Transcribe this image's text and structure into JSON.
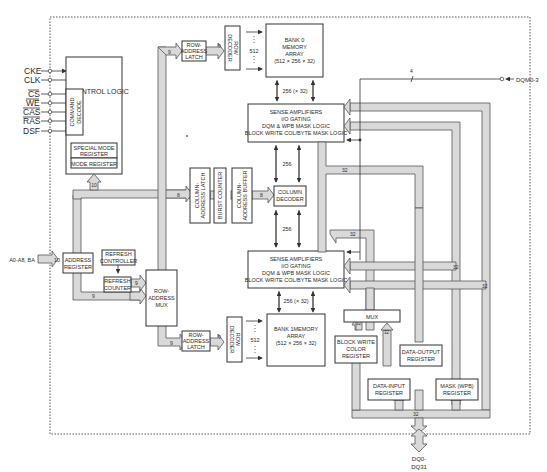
{
  "diagram": {
    "type": "block-diagram",
    "colors": {
      "line": "#333333",
      "bus_fill": "#d9d9d9",
      "background": "#ffffff"
    },
    "inputs": {
      "cke": "CKE",
      "clk": "CLK",
      "cs": "CS",
      "we": "WE",
      "cas": "CAS",
      "ras": "RAS",
      "dsf": "DSF",
      "address": "A0-A8, BA",
      "dqm": "DQM0-3",
      "dq_line1": "DQ0-",
      "dq_line2": "DQ31"
    },
    "blocks": {
      "control_logic": "CONTROL LOGIC",
      "command_decode_1": "COMMAND",
      "command_decode_2": "DECODE",
      "special_mode_register_1": "SPECIAL MODE",
      "special_mode_register_2": "REGISTER",
      "mode_register": "MODE REGISTER",
      "address_register_1": "ADDRESS",
      "address_register_2": "REGISTER",
      "refresh_controller_1": "REFRESH",
      "refresh_controller_2": "CONTROLLER",
      "refresh_counter_1": "REFRESH",
      "refresh_counter_2": "COUNTER",
      "row_address_mux_1": "ROW-",
      "row_address_mux_2": "ADDRESS",
      "row_address_mux_3": "MUX",
      "row_address_latch_top_1": "ROW-",
      "row_address_latch_top_2": "ADDRESS",
      "row_address_latch_top_3": "LATCH",
      "row_address_latch_bot_1": "ROW-",
      "row_address_latch_bot_2": "ADDRESS",
      "row_address_latch_bot_3": "LATCH",
      "row_decoder_top_1": "ROW",
      "row_decoder_top_2": "DECODER",
      "row_decoder_bot_1": "ROW",
      "row_decoder_bot_2": "DECODER",
      "bank0_1": "BANK 0",
      "bank0_2": "MEMORY",
      "bank0_3": "ARRAY",
      "bank0_4": "(512 × 256 × 32)",
      "bank1_1": "BANK 1MEMORY",
      "bank1_2": "ARRAY",
      "bank1_3": "(512 × 256 × 32)",
      "sense_top_1": "SENSE AMPLIFIERS",
      "sense_top_2": "I/O GATING",
      "sense_top_3": "DQM & WPB MASK LOGIC",
      "sense_top_4": "BLOCK WRITE COL/BYTE MASK LOGIC",
      "sense_bot_1": "SENSE AMPLIFIERS",
      "sense_bot_2": "I/O GATING",
      "sense_bot_3": "DQM & WPB MASK LOGIC",
      "sense_bot_4": "BLOCK WRITE COL/BYTE MASK LOGIC",
      "column_address_latch_1": "COLUMN-",
      "column_address_latch_2": "ADDRESS LATCH",
      "burst_counter": "BURST COUNTER",
      "column_address_buffer_1": "COLUMN-",
      "column_address_buffer_2": "ADDRESS BUFFER",
      "column_decoder_1": "COLUMN",
      "column_decoder_2": "DECODER",
      "mux": "MUX",
      "block_write_color_1": "BLOCK WRITE",
      "block_write_color_2": "COLOR",
      "block_write_color_3": "REGISTER",
      "data_output_1": "DATA-OUTPUT",
      "data_output_2": "REGISTER",
      "data_input_1": "DATA-INPUT",
      "data_input_2": "REGISTER",
      "mask_wpb_1": "MASK (WPB)",
      "mask_wpb_2": "REGISTER"
    },
    "bus_labels": {
      "addr_in": "10",
      "to_mode": "10",
      "to_col_latch": "8",
      "to_col_decoder": "8",
      "to_row_latch_top": "9",
      "row_latch_to_dec_top": "9",
      "refresh_to_mux": "9",
      "addr_to_mux": "9",
      "to_row_latch_bot": "9",
      "row_latch_to_dec_bot": "9",
      "rows_top": "512",
      "rows_bot": "512",
      "bank0_cols": "256 (× 32)",
      "bank1_cols": "256 (× 32)",
      "coldec_top": "256",
      "coldec_bot": "256",
      "dqm_width": "4",
      "bus_32_a": "32",
      "bus_32_b": "32",
      "bus_32_c": "32",
      "bus_32_d": "32",
      "bus_32_e": "32",
      "bus_32_f": "32",
      "bus_32_g": "32"
    }
  }
}
